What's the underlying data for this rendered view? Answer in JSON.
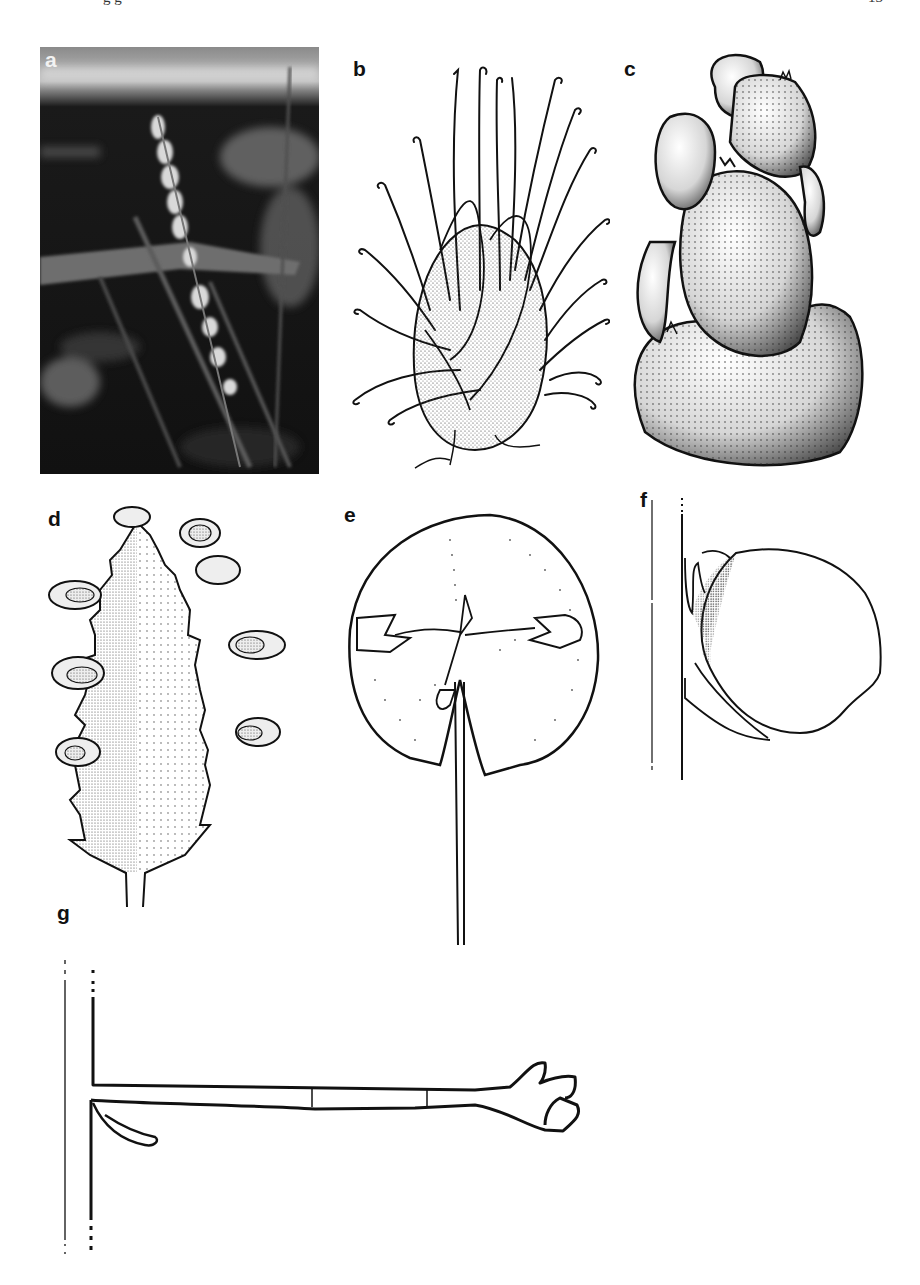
{
  "page": {
    "header_left_clipped": "g                                                                    g",
    "page_number": "13",
    "background": "#ffffff"
  },
  "figure": {
    "panels": [
      {
        "id": "a",
        "label": "a",
        "type": "photograph",
        "description": "Grayscale photo of a slender flowering spike on stem against dark foliage"
      },
      {
        "id": "b",
        "label": "b",
        "type": "line-drawing",
        "description": "Stippled inflorescence cluster with long curled styles"
      },
      {
        "id": "c",
        "label": "c",
        "type": "line-drawing",
        "description": "Heavily stippled lobed fruit cluster"
      },
      {
        "id": "d",
        "label": "d",
        "type": "line-drawing",
        "description": "Serrate leaf with marginal flower clusters, half stippled"
      },
      {
        "id": "e",
        "label": "e",
        "type": "line-drawing",
        "description": "Rounded peltate bract with central flower and long petiole"
      },
      {
        "id": "f",
        "label": "f",
        "type": "line-drawing",
        "description": "Side view of ovate structure attached to stem, partly stippled"
      },
      {
        "id": "g",
        "label": "g",
        "type": "line-drawing",
        "description": "Horizontal jointed branch from vertical stem with terminal bud"
      }
    ]
  }
}
